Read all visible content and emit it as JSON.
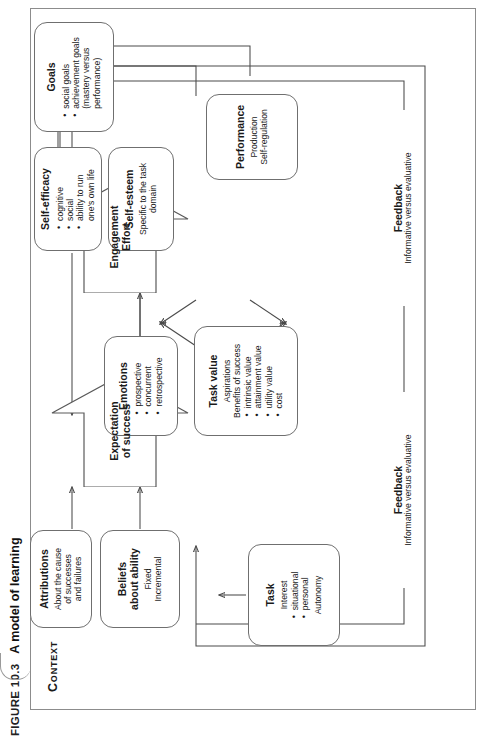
{
  "figure": {
    "tag": "Figure 10.3",
    "title": "A model of learning"
  },
  "context_label": "Context",
  "nodes": {
    "task": {
      "title": "Task",
      "lines": [
        "Interest"
      ],
      "bullets": [
        "situational",
        "personal"
      ],
      "tail": [
        "Autonomy"
      ]
    },
    "beliefs": {
      "title": "Beliefs\nabout ability",
      "lines": [
        "Fixed",
        "Incremental"
      ]
    },
    "attributions": {
      "title": "Attributions",
      "lines": [
        "About the cause",
        "of successes",
        "and failures"
      ]
    },
    "emotions": {
      "title": "Emotions",
      "bullets": [
        "prospective",
        "concurrent",
        "retrospective"
      ]
    },
    "task_value": {
      "title": "Task value",
      "lines": [
        "Aspirations",
        "Benefits of success"
      ],
      "bullets": [
        "intrinsic value",
        "attainment value",
        "utility value",
        "cost"
      ]
    },
    "self_esteem": {
      "title": "Self-esteem",
      "lines": [
        "Specific to the task",
        "domain"
      ]
    },
    "self_efficacy": {
      "title": "Self-efficacy",
      "bullets": [
        "cognitive",
        "social",
        "ability to run"
      ],
      "bullets_cont": [
        "one's own life"
      ]
    },
    "goals": {
      "title": "Goals",
      "bullets": [
        "social goals",
        "achievement goals"
      ],
      "bullets_cont": [
        "(mastery versus",
        "performance)"
      ]
    },
    "performance": {
      "title": "Performance",
      "lines": [
        "Production",
        "Self-regulation"
      ]
    }
  },
  "arrows": {
    "expectation": "Expectation\nof success",
    "engagement": "Engagement\nEffort"
  },
  "feedback": {
    "left": {
      "title": "Feedback",
      "subtitle": "Informative versus evaluative"
    },
    "right": {
      "title": "Feedback",
      "subtitle": "Informative versus evaluative"
    }
  },
  "colors": {
    "frame": "#8c8c8c",
    "node_border": "#6f6f6f",
    "wire": "#4a4a4a",
    "text": "#1a1a1a"
  }
}
